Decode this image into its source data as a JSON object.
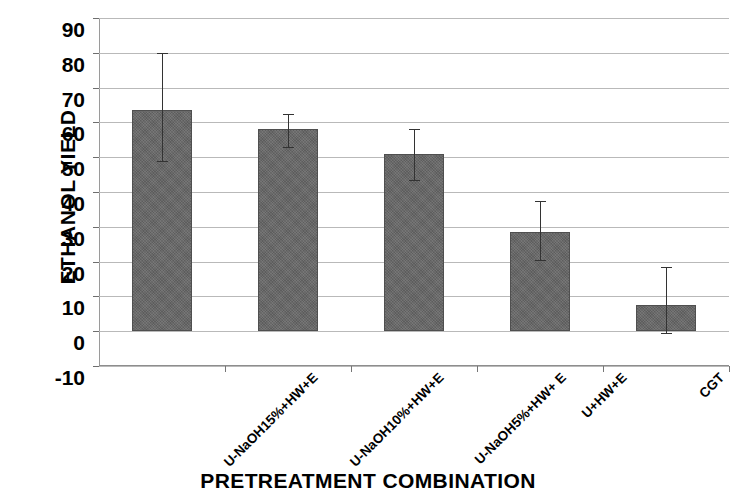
{
  "chart_data": {
    "type": "bar",
    "title": "",
    "xlabel": "PRETREATMENT COMBINATION",
    "ylabel": "ETHANOL YIELD",
    "categories": [
      "U-NaOH15%+HW+E",
      "U-NaOH10%+HW+E",
      "U-NaOH5%+HW+ E",
      "U+HW+E",
      "CGT"
    ],
    "values": [
      63.5,
      58,
      51,
      28.5,
      7.5
    ],
    "errors_upper": [
      80,
      62.5,
      58,
      37.5,
      18.5
    ],
    "errors_lower": [
      49,
      53,
      43.5,
      20.5,
      -0.5
    ],
    "ylim": [
      -10,
      90
    ],
    "ytick_labels": [
      "90",
      "80",
      "70",
      "60",
      "50",
      "40",
      "30",
      "20",
      "10",
      "0",
      "-10"
    ],
    "ytick_values": [
      90,
      80,
      70,
      60,
      50,
      40,
      30,
      20,
      10,
      0,
      -10
    ],
    "grid": true,
    "legend": "none",
    "bar_color": "#666666",
    "grid_color": "#b9b9b9",
    "error_color": "#333333"
  }
}
